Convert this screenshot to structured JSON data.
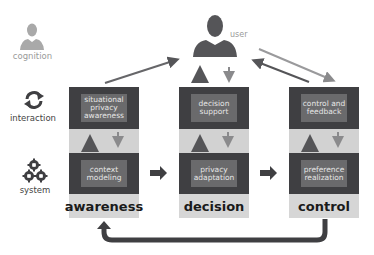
{
  "diagram": {
    "layers": {
      "cognition": "cognition",
      "interaction": "interaction",
      "system": "system"
    },
    "user_label": "user",
    "columns": [
      {
        "phase": "awareness",
        "interaction_box": "situational privacy awareness",
        "system_box": "context modeling"
      },
      {
        "phase": "decision",
        "interaction_box": "decision support",
        "system_box": "privacy adaptation"
      },
      {
        "phase": "control",
        "interaction_box": "control and feedback",
        "system_box": "preference realization"
      }
    ],
    "icons": [
      "person-icon",
      "refresh-cycle-icon",
      "gears-icon"
    ],
    "colors": {
      "dark_panel": "#3f3f42",
      "inner_box": "#6a6a6c",
      "light_band": "#d2d2d2",
      "arrow": "#555558",
      "cognition_icon": "#a9a9a9"
    }
  }
}
